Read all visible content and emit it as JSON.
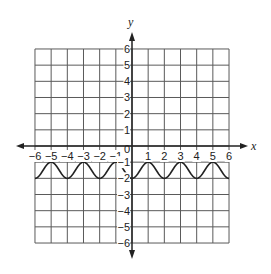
{
  "chart_data": {
    "type": "line",
    "title": "",
    "xlabel": "x",
    "ylabel": "y",
    "xlim": [
      -6,
      6
    ],
    "ylim": [
      -6,
      6
    ],
    "grid": true,
    "x_ticks": [
      -6,
      -5,
      -4,
      -3,
      -2,
      -1,
      0,
      1,
      2,
      3,
      4,
      5,
      6
    ],
    "y_ticks": [
      -6,
      -5,
      -4,
      -3,
      -2,
      -1,
      1,
      2,
      3,
      4,
      5,
      6
    ],
    "x_tick_labels": [
      "−6",
      "−5",
      "−4",
      "−3",
      "−2",
      "−1",
      "0",
      "1",
      "2",
      "3",
      "4",
      "5",
      "6"
    ],
    "y_tick_labels": [
      "−6",
      "−5",
      "−4",
      "−3",
      "−2",
      "−1",
      "1",
      "2",
      "3",
      "4",
      "5",
      "6"
    ],
    "series": [
      {
        "name": "y = -1.5 - 0.5cos(πx)",
        "description": "Periodic wave oscillating between y=-2 (minima at even x) and y=-1 (maxima at odd x), period 2",
        "x": [
          -6,
          -5,
          -4,
          -3,
          -2,
          -1,
          0,
          1,
          2,
          3,
          4,
          5,
          6
        ],
        "values": [
          -2,
          -1,
          -2,
          -1,
          -2,
          -1,
          -2,
          -1,
          -2,
          -1,
          -2,
          -1,
          -2
        ],
        "max": -1,
        "min": -2,
        "period": 2
      }
    ]
  },
  "colors": {
    "grid": "#5a5a5a",
    "axis": "#222222",
    "curve": "#222222"
  }
}
